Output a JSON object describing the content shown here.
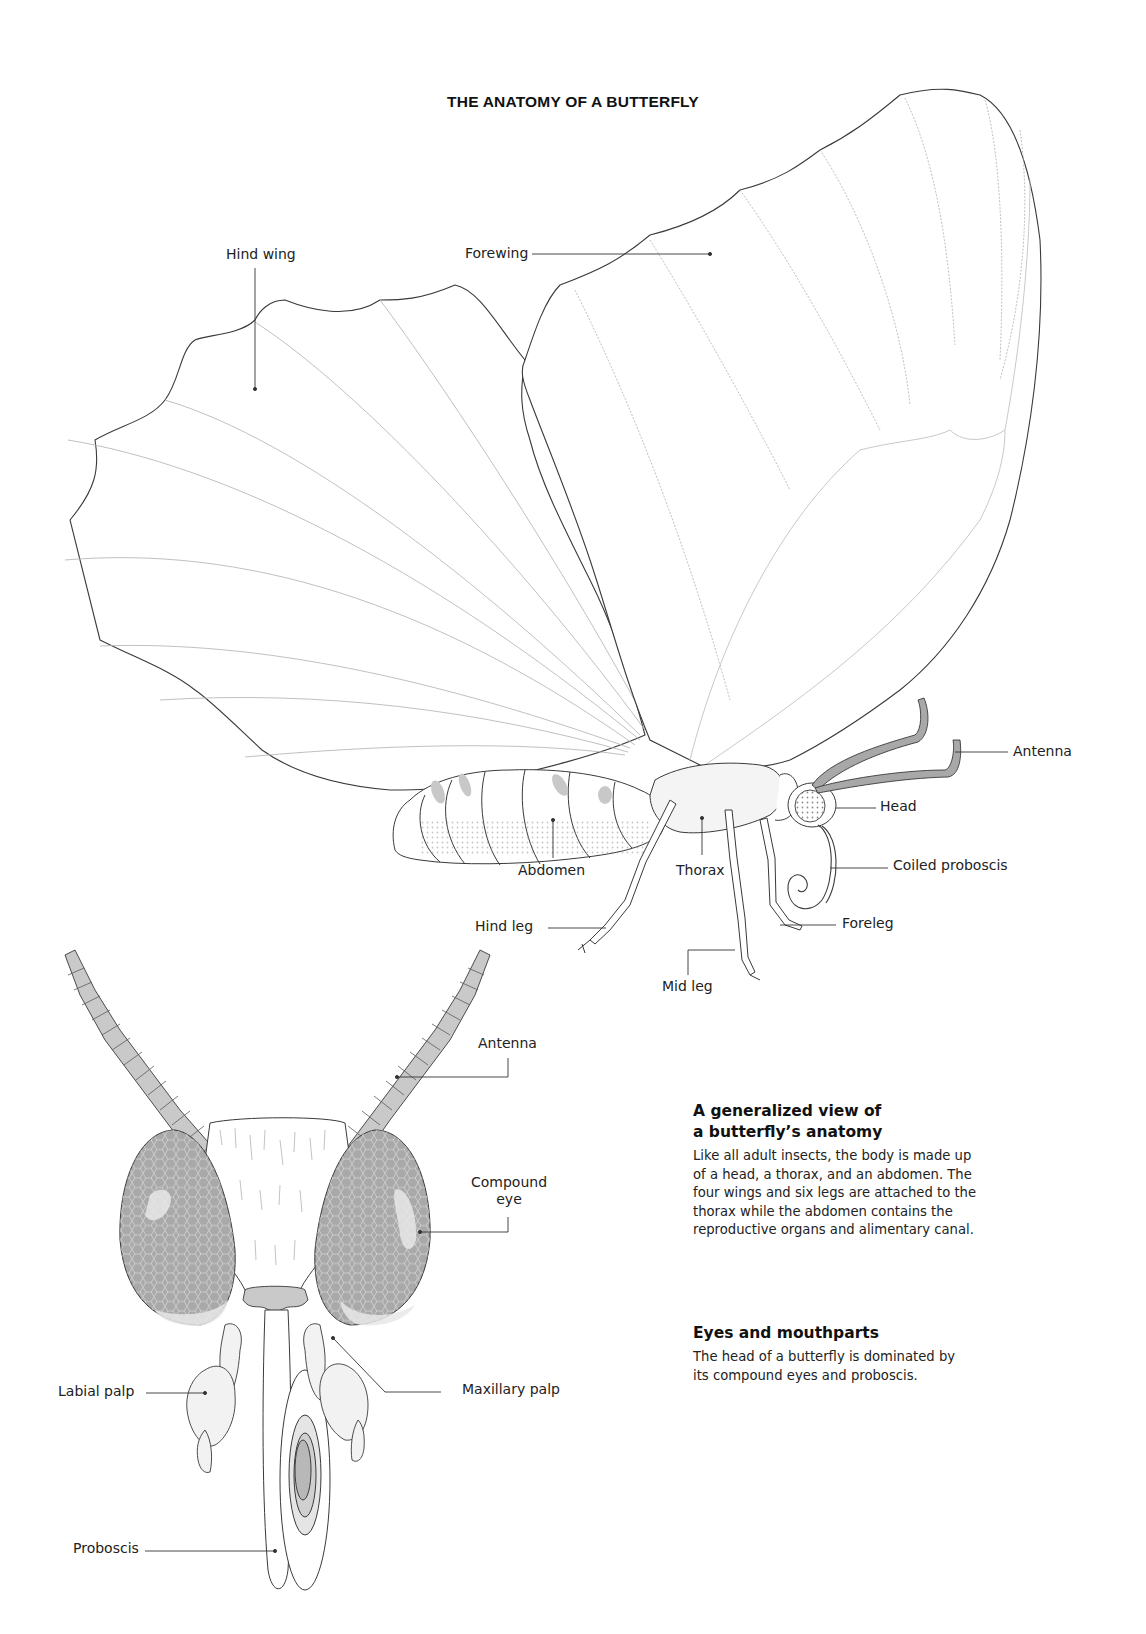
{
  "title": "THE ANATOMY OF A BUTTERFLY",
  "side_view_labels": {
    "hind_wing": "Hind wing",
    "forewing": "Forewing",
    "antenna": "Antenna",
    "head": "Head",
    "coiled_proboscis": "Coiled proboscis",
    "abdomen": "Abdomen",
    "thorax": "Thorax",
    "hind_leg": "Hind leg",
    "foreleg": "Foreleg",
    "mid_leg": "Mid leg"
  },
  "head_view_labels": {
    "antenna": "Antenna",
    "compound_eye_line1": "Compound",
    "compound_eye_line2": "eye",
    "labial_palp": "Labial palp",
    "maxillary_palp": "Maxillary palp",
    "proboscis": "Proboscis"
  },
  "sections": [
    {
      "heading_line1": "A generalized view of",
      "heading_line2": "a butterfly’s anatomy",
      "body": "Like all adult insects, the body is made up of a head, a thorax, and an abdomen. The four wings and six legs are attached to the thorax while the abdomen contains the reproductive organs and alimentary canal."
    },
    {
      "heading_line1": "Eyes and mouthparts",
      "body": "The head of a butterfly is dominated by its compound eyes and proboscis."
    }
  ],
  "colors": {
    "outline": "#3a3a3a",
    "vein": "#b5b5b5",
    "shade": "#bdbdbd",
    "eye_fill": "#a8a8a8",
    "light_shade": "#e2e2e2"
  }
}
